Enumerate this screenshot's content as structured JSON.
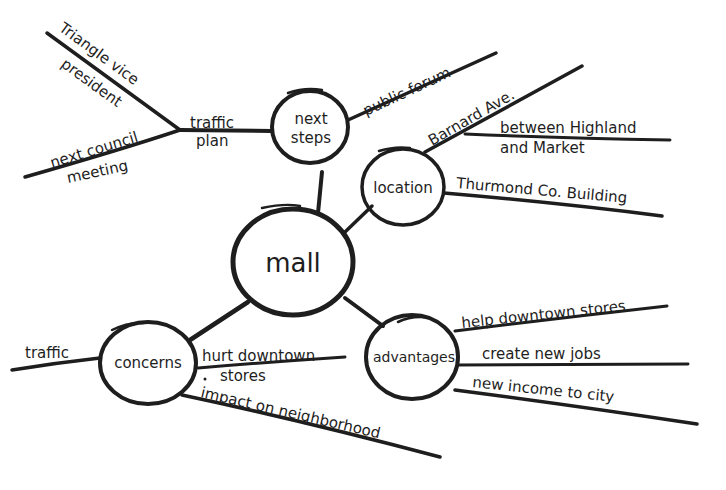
{
  "colors": {
    "ink": "#1e1e1e",
    "background": "#ffffff"
  },
  "center": {
    "label": "mall"
  },
  "nodes": {
    "next_steps": {
      "label_line1": "next",
      "label_line2": "steps",
      "branches": {
        "public_forum": "public forum",
        "traffic_plan_line1": "traffic",
        "traffic_plan_line2": "plan",
        "triangle_line1": "Triangle vice",
        "triangle_line2": "president",
        "council_line1": "next council",
        "council_line2": "meeting"
      }
    },
    "location": {
      "label": "location",
      "branches": {
        "barnard": "Barnard Ave.",
        "between_line1": "between Highland",
        "between_line2": "and Market",
        "thurmond": "Thurmond Co. Building"
      }
    },
    "concerns": {
      "label": "concerns",
      "branches": {
        "traffic": "traffic",
        "hurt_line1": "hurt downtown",
        "hurt_line2": "stores",
        "impact": "impact on neighborhood"
      }
    },
    "advantages": {
      "label": "advantages",
      "branches": {
        "help": "help downtown stores",
        "jobs": "create new jobs",
        "income": "new income to city"
      }
    }
  }
}
